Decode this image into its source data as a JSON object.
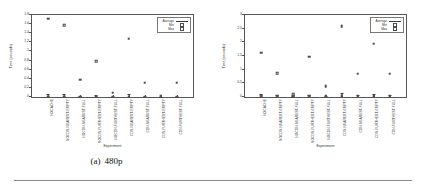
{
  "figure": {
    "panels": [
      {
        "caption_number": "(a)",
        "caption_text": "480p",
        "chart_data": {
          "type": "scatter",
          "title": "",
          "xlabel": "Experiment",
          "ylabel": "Time (seconds)",
          "ylim": [
            0,
            1.8
          ],
          "yticks": [
            "0",
            "0.2",
            "0.4",
            "0.6",
            "0.8",
            "1",
            "1.2",
            "1.4",
            "1.6",
            "1.8"
          ],
          "ytick_values": [
            0,
            0.2,
            0.4,
            0.6,
            0.8,
            1.0,
            1.2,
            1.4,
            1.6,
            1.8
          ],
          "grid": false,
          "legend_position": "top-right",
          "categories": [
            "NOCACHE",
            "NOCDN-NEAREST-EMPTY",
            "NOCDN-NEAREST-FULL",
            "NOCDN-FURTHEST-EMPTY",
            "NOCDN-FURTHEST-FULL",
            "CDN-NEAREST-EMPTY",
            "CDN-NEAREST-FULL",
            "CDN-FURTHEST-EMPTY",
            "CDN-FURTHEST-FULL"
          ],
          "series": [
            {
              "name": "Max",
              "values": [
                1.72,
                1.58,
                0.38,
                0.79,
                0.09,
                1.28,
                0.31,
                0.02,
                0.31
              ]
            },
            {
              "name": "Min",
              "values": [
                0.01,
                0.01,
                0.01,
                0.01,
                0.01,
                0.01,
                0.01,
                0.01,
                0.01
              ]
            },
            {
              "name": "Average",
              "values": [
                0.06,
                0.07,
                0.03,
                0.04,
                0.02,
                0.06,
                0.03,
                0.01,
                0.03
              ]
            }
          ]
        }
      },
      {
        "caption_number": "(b)",
        "caption_text": "1080p",
        "chart_data": {
          "type": "scatter",
          "title": "",
          "xlabel": "Experiment",
          "ylabel": "Time (seconds)",
          "ylim": [
            0,
            3
          ],
          "yticks": [
            "0",
            "0.5",
            "1",
            "1.5",
            "2",
            "2.5",
            "3"
          ],
          "ytick_values": [
            0,
            0.5,
            1.0,
            1.5,
            2.0,
            2.5,
            3.0
          ],
          "grid": false,
          "legend_position": "top-right",
          "categories": [
            "NOCACHE",
            "NOCDN-NEAREST-EMPTY",
            "NOCDN-NEAREST-FULL",
            "NOCDN-FURTHEST-EMPTY",
            "NOCDN-FURTHEST-FULL",
            "CDN-NEAREST-EMPTY",
            "CDN-NEAREST-FULL",
            "CDN-FURTHEST-EMPTY",
            "CDN-FURTHEST-FULL"
          ],
          "series": [
            {
              "name": "Max",
              "values": [
                1.62,
                0.88,
                0.1,
                1.48,
                0.4,
                2.6,
                0.85,
                1.95,
                0.85
              ]
            },
            {
              "name": "Min",
              "values": [
                0.02,
                0.02,
                0.02,
                0.02,
                0.02,
                0.02,
                0.02,
                0.02,
                0.02
              ]
            },
            {
              "name": "Average",
              "values": [
                0.1,
                0.07,
                0.03,
                0.09,
                0.05,
                0.14,
                0.06,
                0.11,
                0.06
              ]
            }
          ]
        }
      }
    ],
    "legend": {
      "entries": [
        {
          "label": "Average",
          "symbol": "line"
        },
        {
          "label": "Min",
          "symbol": "square"
        },
        {
          "label": "Max",
          "symbol": "square"
        }
      ]
    }
  }
}
